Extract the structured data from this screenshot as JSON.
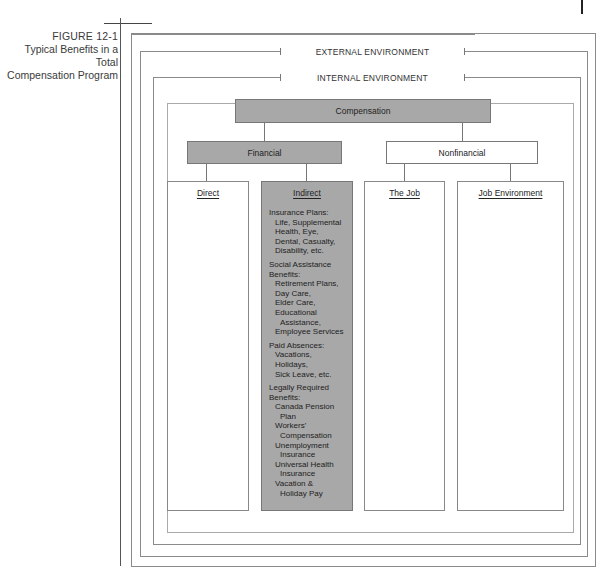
{
  "figure": {
    "number": "FIGURE 12-1",
    "title_line1": "Typical Benefits in a Total",
    "title_line2": "Compensation Program"
  },
  "environments": {
    "external": "EXTERNAL ENVIRONMENT",
    "internal": "INTERNAL ENVIRONMENT"
  },
  "tree": {
    "root": "Compensation",
    "financial": "Financial",
    "nonfinancial": "Nonfinancial",
    "direct": "Direct",
    "indirect": "Indirect",
    "the_job": "The Job",
    "job_environment": "Job Environment"
  },
  "indirect_benefits": [
    {
      "heading": [
        "Insurance Plans:"
      ],
      "items": [
        [
          "Life, Supplemental",
          "Health, Eye,",
          "Dental, Casualty,",
          "Disability, etc."
        ]
      ]
    },
    {
      "heading": [
        "Social Assistance",
        "Benefits:"
      ],
      "items": [
        [
          "Retirement Plans,",
          "Day Care,",
          "Elder Care,",
          "Educational"
        ],
        [
          "Assistance,"
        ],
        [
          "Employee Services"
        ]
      ]
    },
    {
      "heading": [
        "Paid Absences:"
      ],
      "items": [
        [
          "Vacations,",
          "Holidays,",
          "Sick Leave, etc."
        ]
      ]
    },
    {
      "heading": [
        "Legally Required",
        "Benefits:"
      ],
      "items": [
        [
          "Canada Pension"
        ],
        [
          "Plan"
        ],
        [
          "Workers'"
        ],
        [
          "Compensation"
        ],
        [
          "Unemployment"
        ],
        [
          "Insurance"
        ],
        [
          "Universal Health"
        ],
        [
          "Insurance"
        ],
        [
          "Vacation &"
        ],
        [
          "Holiday Pay"
        ]
      ]
    }
  ],
  "colors": {
    "shaded_fill": "#a8a8a8",
    "frame_line": "#8a8a8a",
    "text": "#222222"
  }
}
